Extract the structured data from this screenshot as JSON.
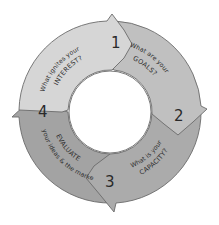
{
  "diagram": {
    "type": "cycle",
    "steps": [
      {
        "number": "1",
        "line1": "What ignites your",
        "line2": "INTEREST?",
        "color": "#d6d6d6"
      },
      {
        "number": "2",
        "line1": "What are your",
        "line2": "GOALS?",
        "color": "#c0c0c0"
      },
      {
        "number": "3",
        "line1": "What is your",
        "line2": "CAPACITY?",
        "color": "#ababab"
      },
      {
        "number": "4",
        "line1": "EVALUATE",
        "line2": "your ideas & the market",
        "color": "#a3a3a3"
      }
    ],
    "stroke_color": "#6b6b6b",
    "background": "#ffffff"
  }
}
